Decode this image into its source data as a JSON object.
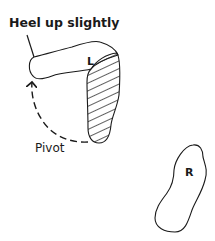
{
  "diagram": {
    "annotations": {
      "heel_label": "Heel up slightly",
      "pivot_label": "Pivot"
    },
    "feet": [
      {
        "id": "left",
        "label": "L",
        "state": "pivoting, heel raised, ball of foot shaded"
      },
      {
        "id": "right",
        "label": "R",
        "state": "static"
      }
    ],
    "colors": {
      "stroke": "#1a1a1a",
      "background": "#ffffff"
    }
  }
}
